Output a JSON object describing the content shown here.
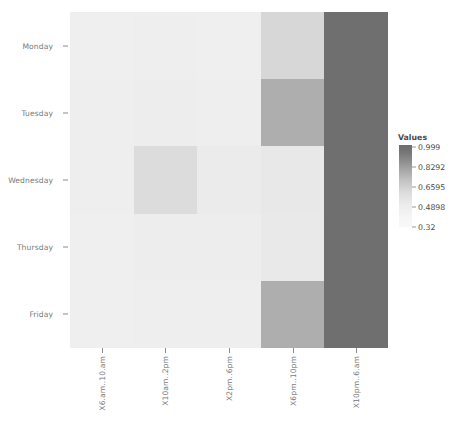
{
  "chart_data": {
    "type": "heatmap",
    "title": "",
    "xlabel": "",
    "ylabel": "",
    "legend_title": "Values",
    "legend_position": "right",
    "grid": false,
    "categories_x": [
      "X6.am..10.am",
      "X10am..2pm",
      "X2pm..6pm",
      "X6pm..10pm",
      "X10pm..6.am"
    ],
    "categories_y": [
      "Monday",
      "Tuesday",
      "Wednesday",
      "Thursday",
      "Friday"
    ],
    "legend_ticks": [
      "0.999",
      "0.8292",
      "0.6595",
      "0.4898",
      "0.32"
    ],
    "zlim": [
      0.32,
      0.999
    ],
    "colorscale": "grayscale-reversed",
    "values": [
      [
        0.33,
        0.33,
        0.33,
        0.45,
        0.93
      ],
      [
        0.33,
        0.33,
        0.33,
        0.62,
        0.93
      ],
      [
        0.33,
        0.41,
        0.34,
        0.36,
        0.93
      ],
      [
        0.33,
        0.33,
        0.33,
        0.36,
        0.93
      ],
      [
        0.33,
        0.33,
        0.33,
        0.62,
        0.93
      ]
    ],
    "cell_colors": [
      [
        "#efefef",
        "#eeeeee",
        "#efefef",
        "#d7d7d7",
        "#6f6f6f"
      ],
      [
        "#eeeeee",
        "#ededed",
        "#eeeeee",
        "#aeaeae",
        "#6f6f6f"
      ],
      [
        "#eeeeee",
        "#dcdcdc",
        "#ebebeb",
        "#e8e8e8",
        "#6f6f6f"
      ],
      [
        "#efefef",
        "#ededed",
        "#ededed",
        "#e9e9e9",
        "#6f6f6f"
      ],
      [
        "#efefef",
        "#eeeeee",
        "#eeeeee",
        "#aeaeae",
        "#6f6f6f"
      ]
    ],
    "colors": {
      "high": "#6f6f6f",
      "low": "#f7f7f7",
      "mid": "#aeaeae",
      "axis_text": "#7a7a7a",
      "legend_text": "#4a4a4a",
      "background": "#ffffff"
    }
  }
}
